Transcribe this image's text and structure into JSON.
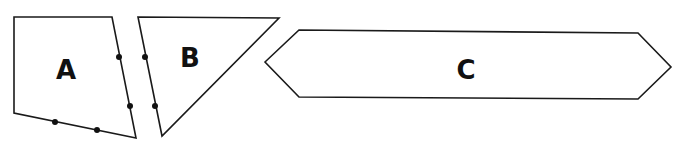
{
  "diagram": {
    "title": "",
    "stroke_color": "#1a1a1a",
    "fill_color": "#ffffff",
    "shapes": [
      {
        "id": "A",
        "label": "A",
        "type": "quadrilateral",
        "points": [
          [
            14,
            17
          ],
          [
            112,
            17
          ],
          [
            136,
            138
          ],
          [
            14,
            113
          ]
        ],
        "label_pos": [
          66,
          79
        ],
        "dots": [
          [
            119,
            57
          ],
          [
            130,
            106
          ],
          [
            55,
            122
          ],
          [
            97,
            130
          ]
        ]
      },
      {
        "id": "B",
        "label": "B",
        "type": "triangle",
        "points": [
          [
            138,
            17
          ],
          [
            279,
            18
          ],
          [
            162,
            136
          ]
        ],
        "label_pos": [
          190,
          67
        ],
        "dots": [
          [
            145,
            57
          ],
          [
            155,
            106
          ]
        ]
      },
      {
        "id": "C",
        "label": "C",
        "type": "hexagon",
        "points": [
          [
            265,
            62
          ],
          [
            299,
            30
          ],
          [
            638,
            33
          ],
          [
            671,
            67
          ],
          [
            638,
            99
          ],
          [
            299,
            97
          ]
        ],
        "label_pos": [
          466,
          79
        ],
        "dots": []
      }
    ]
  }
}
